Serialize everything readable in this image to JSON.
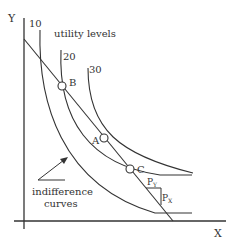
{
  "diagram": {
    "type": "indifference-curves-budget-line",
    "axes": {
      "x_label": "X",
      "y_label": "Y"
    },
    "title_label": "utility levels",
    "curves": [
      {
        "label": "10",
        "role": "indifference-curve"
      },
      {
        "label": "20",
        "role": "indifference-curve"
      },
      {
        "label": "30",
        "role": "indifference-curve"
      }
    ],
    "points": [
      {
        "label": "B"
      },
      {
        "label": "A"
      },
      {
        "label": "C"
      }
    ],
    "budget_line": {
      "slope_labels": {
        "rise": "P",
        "rise_sub": "Y",
        "run": "P",
        "run_sub": "X"
      }
    },
    "annotation": {
      "line1": "indifference",
      "line2": "curves"
    },
    "colors": {
      "stroke": "#333333",
      "background": "#ffffff"
    }
  }
}
